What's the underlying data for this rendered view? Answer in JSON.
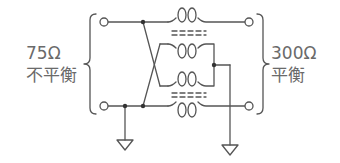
{
  "diagram": {
    "type": "balun circuit (75Ω unbalanced to 300Ω balanced)",
    "left_side": {
      "impedance": "75Ω",
      "label": "不平衡"
    },
    "right_side": {
      "impedance": "300Ω",
      "label": "平衡"
    },
    "components": [
      {
        "name": "top-transformer",
        "windings": 2
      },
      {
        "name": "bottom-transformer",
        "windings": 2
      },
      {
        "name": "left-ground",
        "symbol": "ground"
      },
      {
        "name": "right-ground",
        "symbol": "ground"
      }
    ],
    "terminals": [
      "left-top",
      "left-bottom",
      "right-top",
      "right-bottom"
    ],
    "colors": {
      "line": "#555555",
      "text": "#6a6a6a"
    }
  }
}
